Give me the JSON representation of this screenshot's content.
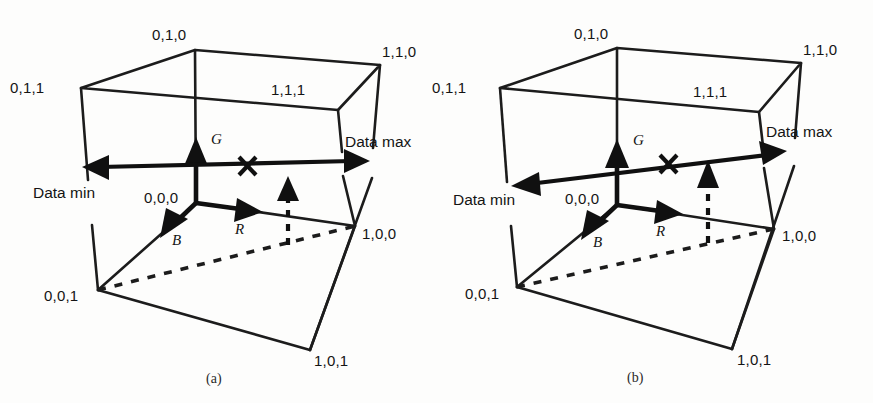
{
  "figure": {
    "title_absent": true,
    "background_color": "#fdfdfc",
    "ink_color": "#101010"
  },
  "panels": [
    {
      "id": "a",
      "caption": "(a)",
      "vertex_labels": [
        {
          "name": "vertex-0-1-0",
          "text": "0,1,0"
        },
        {
          "name": "vertex-1-1-0",
          "text": "1,1,0"
        },
        {
          "name": "vertex-0-1-1",
          "text": "0,1,1"
        },
        {
          "name": "vertex-1-1-1",
          "text": "1,1,1"
        },
        {
          "name": "vertex-0-0-0",
          "text": "0,0,0"
        },
        {
          "name": "vertex-1-0-0",
          "text": "1,0,0"
        },
        {
          "name": "vertex-0-0-1",
          "text": "0,0,1"
        },
        {
          "name": "vertex-1-0-1",
          "text": "1,0,1"
        }
      ],
      "axis_labels": [
        {
          "name": "axis-label-g",
          "text": "G"
        },
        {
          "name": "axis-label-r",
          "text": "R"
        },
        {
          "name": "axis-label-b",
          "text": "B"
        }
      ],
      "data_labels": [
        {
          "name": "data-min-label",
          "text": "Data min"
        },
        {
          "name": "data-max-label",
          "text": "Data max"
        }
      ],
      "data_line": {
        "orientation": "horizontal",
        "description": "double-headed arrow from Data min to Data max, parallel to the red axis"
      },
      "marker": {
        "name": "x-marker",
        "glyph": "X"
      },
      "projection_arrow": {
        "name": "dashed-projection-arrow",
        "style": "dashed",
        "direction": "up"
      }
    },
    {
      "id": "b",
      "caption": "(b)",
      "vertex_labels": [
        {
          "name": "vertex-0-1-0",
          "text": "0,1,0"
        },
        {
          "name": "vertex-1-1-0",
          "text": "1,1,0"
        },
        {
          "name": "vertex-0-1-1",
          "text": "0,1,1"
        },
        {
          "name": "vertex-1-1-1",
          "text": "1,1,1"
        },
        {
          "name": "vertex-0-0-0",
          "text": "0,0,0"
        },
        {
          "name": "vertex-1-0-0",
          "text": "1,0,0"
        },
        {
          "name": "vertex-0-0-1",
          "text": "0,0,1"
        },
        {
          "name": "vertex-1-0-1",
          "text": "1,0,1"
        }
      ],
      "axis_labels": [
        {
          "name": "axis-label-g",
          "text": "G"
        },
        {
          "name": "axis-label-r",
          "text": "R"
        },
        {
          "name": "axis-label-b",
          "text": "B"
        }
      ],
      "data_labels": [
        {
          "name": "data-min-label",
          "text": "Data min"
        },
        {
          "name": "data-max-label",
          "text": "Data max"
        }
      ],
      "data_line": {
        "orientation": "tilted",
        "description": "double-headed arrow from Data min to Data max, tilted upward toward the right"
      },
      "marker": {
        "name": "x-marker",
        "glyph": "X"
      },
      "projection_arrow": {
        "name": "dashed-projection-arrow",
        "style": "dashed",
        "direction": "up"
      }
    }
  ]
}
